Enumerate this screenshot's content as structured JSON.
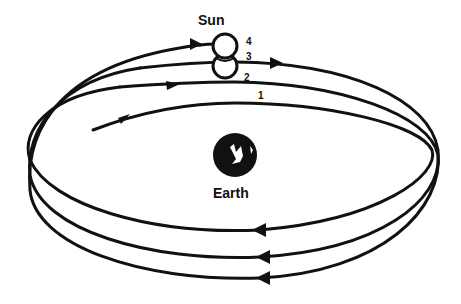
{
  "diagram": {
    "sun_label": "Sun",
    "earth_label": "Earth",
    "positions": [
      "1",
      "2",
      "3",
      "4"
    ],
    "stroke_color": "#111111",
    "background": "#ffffff",
    "icons": {
      "sun": "sun-circle-icon",
      "earth": "earth-globe-icon",
      "arrow": "direction-arrow-icon"
    }
  }
}
